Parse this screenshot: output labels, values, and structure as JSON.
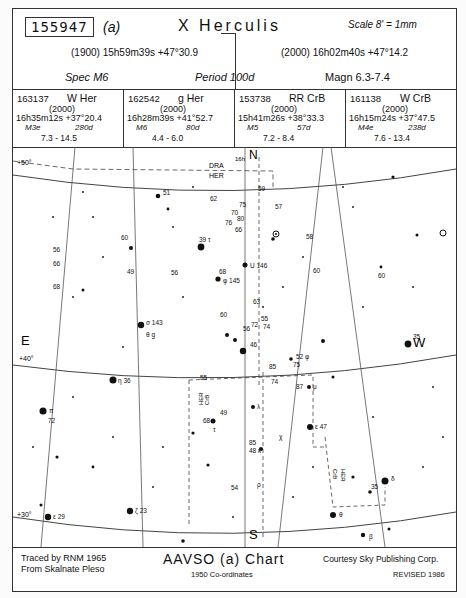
{
  "header": {
    "chart_id": "155947",
    "chart_suffix": "(a)",
    "star_name": "X Herculis",
    "scale": "Scale 8' = 1mm",
    "coords_1900": "(1900)  15h59m39s  +47°30.9",
    "coords_2000": "(2000)  16h02m40s  +47°14.2",
    "spec": "Spec M6",
    "period": "Period 100d",
    "magnitude": "Magn 6.3-7.4"
  },
  "comparison_stars": [
    {
      "id": "163137",
      "name": "W Her",
      "epoch": "(2000)",
      "ra_dec": "16h35m12s  +37°20.4",
      "spec": "M3e",
      "period": "280d",
      "range": "7.3 - 14.5"
    },
    {
      "id": "162542",
      "name": "g Her",
      "epoch": "(2000)",
      "ra_dec": "16h28m39s  +41°52.7",
      "spec": "M6",
      "period": "80d",
      "range": "4.4 - 6.0"
    },
    {
      "id": "153738",
      "name": "RR CrB",
      "epoch": "(2000)",
      "ra_dec": "15h41m26s  +38°33.3",
      "spec": "M5",
      "period": "57d",
      "range": "7.2 - 8.4"
    },
    {
      "id": "161138",
      "name": "W CrB",
      "epoch": "(2000)",
      "ra_dec": "16h15m24s  +37°47.5",
      "spec": "M4e",
      "period": "238d",
      "range": "7.6 - 13.4"
    }
  ],
  "chart": {
    "directions": {
      "north": "N",
      "south": "S",
      "east": "E",
      "west": "W"
    },
    "declination_labels": [
      "+50°",
      "+40°",
      "+30°"
    ],
    "ra_label": "16h",
    "constellation_boundaries": [
      "DRA",
      "HER",
      "CrB",
      "HER",
      "CrB"
    ],
    "star_labels": [
      {
        "label": "51",
        "x": 148,
        "y": 49
      },
      {
        "label": "62",
        "x": 195,
        "y": 52
      },
      {
        "label": "70",
        "x": 218,
        "y": 68
      },
      {
        "label": "75",
        "x": 226,
        "y": 60
      },
      {
        "label": "76",
        "x": 212,
        "y": 78
      },
      {
        "label": "80",
        "x": 224,
        "y": 74
      },
      {
        "label": "66",
        "x": 222,
        "y": 84
      },
      {
        "label": "59",
        "x": 245,
        "y": 42
      },
      {
        "label": "57",
        "x": 262,
        "y": 62
      },
      {
        "label": "58",
        "x": 293,
        "y": 90
      },
      {
        "label": "60",
        "x": 108,
        "y": 92
      },
      {
        "label": "56",
        "x": 40,
        "y": 104
      },
      {
        "label": "56",
        "x": 158,
        "y": 126
      },
      {
        "label": "66",
        "x": 40,
        "y": 118
      },
      {
        "label": "68",
        "x": 40,
        "y": 140
      },
      {
        "label": "49",
        "x": 114,
        "y": 124
      },
      {
        "label": "39 τ",
        "x": 188,
        "y": 110
      },
      {
        "label": "U 146",
        "x": 234,
        "y": 120
      },
      {
        "label": "68",
        "x": 208,
        "y": 131
      },
      {
        "label": "φ 145",
        "x": 210,
        "y": 138
      },
      {
        "label": "60",
        "x": 300,
        "y": 124
      },
      {
        "label": "60",
        "x": 206,
        "y": 170
      },
      {
        "label": "60",
        "x": 365,
        "y": 130
      },
      {
        "label": "63",
        "x": 239,
        "y": 156
      },
      {
        "label": "σ 143",
        "x": 162,
        "y": 175
      },
      {
        "label": "g",
        "x": 162,
        "y": 188
      },
      {
        "label": "55",
        "x": 249,
        "y": 174
      },
      {
        "label": "56",
        "x": 234,
        "y": 182
      },
      {
        "label": "72",
        "x": 262,
        "y": 178
      },
      {
        "label": "74",
        "x": 277,
        "y": 182
      },
      {
        "label": "46",
        "x": 236,
        "y": 194
      },
      {
        "label": "52 φ",
        "x": 288,
        "y": 212
      },
      {
        "label": "85",
        "x": 257,
        "y": 220
      },
      {
        "label": "75",
        "x": 281,
        "y": 218
      },
      {
        "label": "35",
        "x": 404,
        "y": 200
      },
      {
        "label": "η 36",
        "x": 104,
        "y": 235
      },
      {
        "label": "π",
        "x": 44,
        "y": 268
      },
      {
        "label": "72",
        "x": 46,
        "y": 276
      },
      {
        "label": "55",
        "x": 187,
        "y": 232
      },
      {
        "label": "74",
        "x": 259,
        "y": 235
      },
      {
        "label": "87",
        "x": 288,
        "y": 240
      },
      {
        "label": "μ",
        "x": 312,
        "y": 240
      },
      {
        "label": "λ",
        "x": 252,
        "y": 260
      },
      {
        "label": "68",
        "x": 190,
        "y": 275
      },
      {
        "label": "49",
        "x": 207,
        "y": 274
      },
      {
        "label": "τ",
        "x": 207,
        "y": 284
      },
      {
        "label": "85",
        "x": 248,
        "y": 296
      },
      {
        "label": "ε 47",
        "x": 303,
        "y": 280
      },
      {
        "label": "48 κ",
        "x": 253,
        "y": 302
      },
      {
        "label": "χ",
        "x": 268,
        "y": 290
      },
      {
        "label": "54",
        "x": 218,
        "y": 343
      },
      {
        "label": "ζ 23",
        "x": 128,
        "y": 364
      },
      {
        "label": "ε 29",
        "x": 66,
        "y": 375
      },
      {
        "label": "ρ",
        "x": 240,
        "y": 340
      },
      {
        "label": "δ",
        "x": 380,
        "y": 333
      },
      {
        "label": "35",
        "x": 358,
        "y": 342
      },
      {
        "label": "θ",
        "x": 324,
        "y": 370
      },
      {
        "label": "β",
        "x": 372,
        "y": 392
      }
    ]
  },
  "footer": {
    "traced_by": "Traced by RNM 1965",
    "source": "From Skalnate Pleso",
    "chart_type": "AAVSO (a) Chart",
    "coords_note": "1950 Co-ordinates",
    "courtesy": "Courtesy Sky Publishing Corp.",
    "revised": "REVISED 1986"
  },
  "colors": {
    "ink": "#111111",
    "paper": "#ffffff",
    "grid": "#555555"
  }
}
